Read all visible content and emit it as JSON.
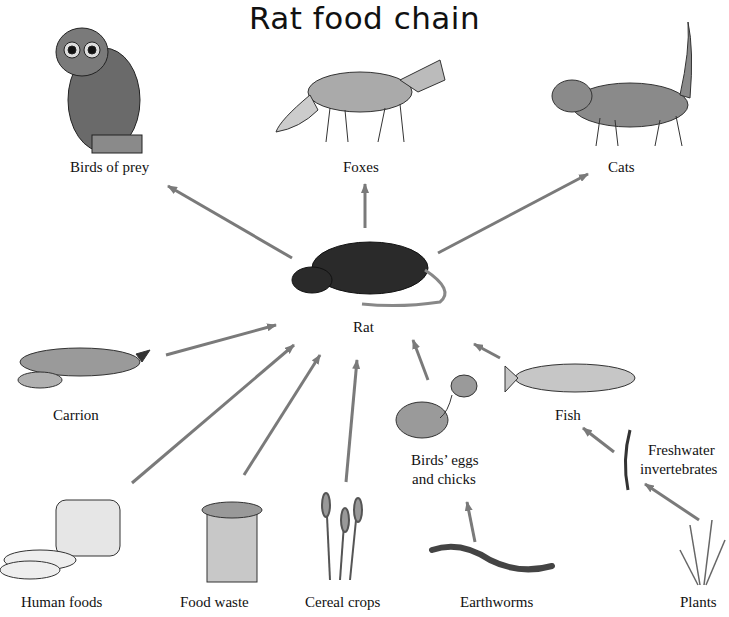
{
  "title": "Rat food chain",
  "center": {
    "label": "Rat"
  },
  "predators": [
    {
      "label": "Birds of prey"
    },
    {
      "label": "Foxes"
    },
    {
      "label": "Cats"
    }
  ],
  "food_sources": [
    {
      "label": "Carrion"
    },
    {
      "label": "Human foods"
    },
    {
      "label": "Food waste"
    },
    {
      "label": "Cereal crops"
    },
    {
      "label": "Birds’ eggs"
    },
    {
      "label": "and chicks"
    },
    {
      "label": "Fish"
    },
    {
      "label": "Freshwater"
    },
    {
      "label": "invertebrates"
    },
    {
      "label": "Earthworms"
    },
    {
      "label": "Plants"
    }
  ],
  "colors": {
    "arrow": "#7a7a7a",
    "text": "#111111"
  }
}
